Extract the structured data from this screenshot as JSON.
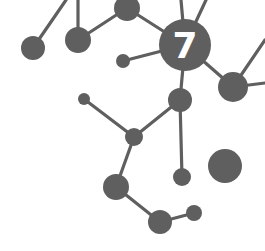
{
  "graphic": {
    "label": "7",
    "colors": {
      "node": "#5f5f5f",
      "edge": "#5f5f5f",
      "label": "#ffffff",
      "background": "#ffffff"
    },
    "nodes": [
      {
        "id": "a",
        "cx": 33,
        "cy": 48,
        "r": 12
      },
      {
        "id": "b",
        "cx": 78,
        "cy": 40,
        "r": 13
      },
      {
        "id": "c",
        "cx": 127,
        "cy": 8,
        "r": 13
      },
      {
        "id": "hub",
        "cx": 185,
        "cy": 45,
        "r": 26
      },
      {
        "id": "d",
        "cx": 123,
        "cy": 61,
        "r": 7
      },
      {
        "id": "e",
        "cx": 233,
        "cy": 87,
        "r": 15
      },
      {
        "id": "f",
        "cx": 180,
        "cy": 100,
        "r": 12
      },
      {
        "id": "g",
        "cx": 84,
        "cy": 99,
        "r": 6
      },
      {
        "id": "h",
        "cx": 134,
        "cy": 137,
        "r": 9
      },
      {
        "id": "i",
        "cx": 182,
        "cy": 177,
        "r": 9
      },
      {
        "id": "j",
        "cx": 225,
        "cy": 166,
        "r": 17
      },
      {
        "id": "k",
        "cx": 116,
        "cy": 187,
        "r": 13
      },
      {
        "id": "l",
        "cx": 160,
        "cy": 222,
        "r": 12
      },
      {
        "id": "m",
        "cx": 194,
        "cy": 213,
        "r": 8
      }
    ],
    "edges": [
      {
        "x1": 33,
        "y1": 48,
        "x2": 66,
        "y2": 0
      },
      {
        "x1": 78,
        "y1": 40,
        "x2": 78,
        "y2": 0
      },
      {
        "x1": 78,
        "y1": 40,
        "x2": 127,
        "y2": 8
      },
      {
        "x1": 127,
        "y1": 8,
        "x2": 185,
        "y2": 45
      },
      {
        "x1": 185,
        "y1": 45,
        "x2": 181,
        "y2": 0
      },
      {
        "x1": 185,
        "y1": 45,
        "x2": 206,
        "y2": 0
      },
      {
        "x1": 123,
        "y1": 61,
        "x2": 185,
        "y2": 45
      },
      {
        "x1": 185,
        "y1": 45,
        "x2": 233,
        "y2": 87
      },
      {
        "x1": 233,
        "y1": 87,
        "x2": 265,
        "y2": 40
      },
      {
        "x1": 233,
        "y1": 87,
        "x2": 265,
        "y2": 83
      },
      {
        "x1": 185,
        "y1": 45,
        "x2": 180,
        "y2": 100
      },
      {
        "x1": 180,
        "y1": 100,
        "x2": 134,
        "y2": 137
      },
      {
        "x1": 84,
        "y1": 99,
        "x2": 134,
        "y2": 137
      },
      {
        "x1": 134,
        "y1": 137,
        "x2": 116,
        "y2": 187
      },
      {
        "x1": 180,
        "y1": 100,
        "x2": 182,
        "y2": 177
      },
      {
        "x1": 116,
        "y1": 187,
        "x2": 160,
        "y2": 222
      },
      {
        "x1": 160,
        "y1": 222,
        "x2": 194,
        "y2": 213
      }
    ]
  }
}
